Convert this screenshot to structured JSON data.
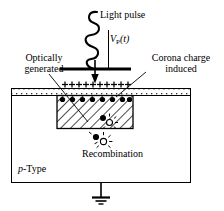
{
  "figure": {
    "type": "semiconductor-device-cross-section",
    "background_color": "#ffffff",
    "line_color": "#000000"
  },
  "labels": {
    "light_pulse": "Light pulse",
    "vp_symbol": "V",
    "vp_subscript": "P",
    "vp_arg": "(t)",
    "optically_generated_line1": "Optically",
    "optically_generated_line2": "generated",
    "corona_charge_line1": "Corona charge",
    "corona_charge_line2": "induced",
    "recombination": "Recombination",
    "ptype_italic": "p",
    "ptype_rest": "-Type"
  },
  "elements": {
    "light_wave": {
      "name": "wavy-light-arrow",
      "turns": 4
    },
    "electrode_bar": {
      "name": "horizontal-electrode-bar",
      "x1": 60,
      "x2": 131,
      "y": 69
    },
    "down_arrow": {
      "name": "light-pulse-down-arrow",
      "x": 95,
      "y_top": 22,
      "y_bottom": 80
    },
    "vp_vertical_line": {
      "name": "vp-potential-line",
      "x": 108,
      "y_top": 30,
      "y_bottom": 69
    },
    "surface_charge": {
      "name": "positive-corona-charge-row",
      "symbol": "+",
      "count": 10
    },
    "depletion_region": {
      "name": "hatched-depletion-region",
      "x": 57,
      "y": 95,
      "width": 76,
      "height": 33,
      "fill": "diagonal-hatch"
    },
    "negative_charge_dots": {
      "name": "negative-charge-dot-row",
      "count": 8
    },
    "recombination_events": {
      "name": "electron-hole-recombination-symbol",
      "count": 2
    },
    "substrate_box": {
      "name": "p-type-substrate-box",
      "x": 11,
      "y": 88,
      "width": 180,
      "height": 95
    },
    "oxide_layer": {
      "name": "oxide-stippled-layer",
      "x": 11,
      "y": 88,
      "width": 180,
      "height": 7
    },
    "ground": {
      "name": "ground-symbol",
      "x": 101,
      "y": 183,
      "bars": 3
    }
  }
}
